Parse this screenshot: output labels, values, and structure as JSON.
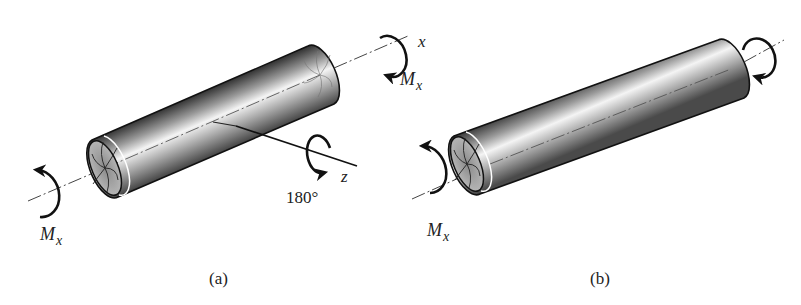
{
  "figures": [
    {
      "id": "a",
      "caption": "(a)",
      "moment_labels": [
        {
          "symbol": "M",
          "subscript": "x",
          "position": "left-end"
        },
        {
          "symbol": "M",
          "subscript": "x",
          "position": "right-end"
        }
      ],
      "axis_labels": {
        "x": "x",
        "z": "z"
      },
      "rotation_label": "180°",
      "description": "Circular shaft under torque Mx at both ends, with z axis through center and 180° rotation about z"
    },
    {
      "id": "b",
      "caption": "(b)",
      "moment_labels": [
        {
          "symbol": "M",
          "subscript": "x",
          "position": "left-end"
        }
      ],
      "description": "Same shaft after 180° rotation about z axis"
    }
  ],
  "colors": {
    "ink": "#111111",
    "shaft_light": "#f2f2f2",
    "shaft_dark": "#555555",
    "axis_line": "#444444"
  }
}
